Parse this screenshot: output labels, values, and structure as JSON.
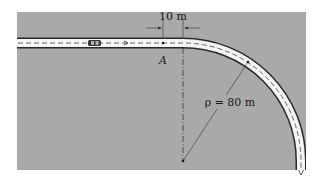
{
  "figure": {
    "background_color": "#a9a9a9",
    "road_color": "#f4f4f4",
    "road_edge_color": "#2a2a2a",
    "dimension_label": "10 m",
    "point_label": "A",
    "radius_label": "ρ = 80 m",
    "radius_value_m": 80,
    "offset_value_m": 10
  }
}
